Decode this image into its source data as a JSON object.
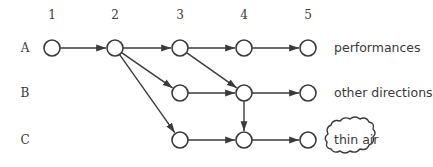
{
  "diagram": {
    "type": "directed-graph",
    "columns": [
      {
        "id": "1",
        "label": "1",
        "x": 52
      },
      {
        "id": "2",
        "label": "2",
        "x": 115
      },
      {
        "id": "3",
        "label": "3",
        "x": 180
      },
      {
        "id": "4",
        "label": "4",
        "x": 244
      },
      {
        "id": "5",
        "label": "5",
        "x": 308
      }
    ],
    "rows": [
      {
        "id": "A",
        "label": "A",
        "y": 48
      },
      {
        "id": "B",
        "label": "B",
        "y": 93
      },
      {
        "id": "C",
        "label": "C",
        "y": 140
      }
    ],
    "nodes": [
      {
        "id": "A1",
        "col": "1",
        "row": "A"
      },
      {
        "id": "A2",
        "col": "2",
        "row": "A"
      },
      {
        "id": "A3",
        "col": "3",
        "row": "A"
      },
      {
        "id": "A4",
        "col": "4",
        "row": "A"
      },
      {
        "id": "A5",
        "col": "5",
        "row": "A"
      },
      {
        "id": "B3",
        "col": "3",
        "row": "B"
      },
      {
        "id": "B4",
        "col": "4",
        "row": "B"
      },
      {
        "id": "B5",
        "col": "5",
        "row": "B"
      },
      {
        "id": "C3",
        "col": "3",
        "row": "C"
      },
      {
        "id": "C4",
        "col": "4",
        "row": "C"
      },
      {
        "id": "C5",
        "col": "5",
        "row": "C"
      }
    ],
    "edges": [
      {
        "from": "A1",
        "to": "A2"
      },
      {
        "from": "A2",
        "to": "A3"
      },
      {
        "from": "A2",
        "to": "B3"
      },
      {
        "from": "A2",
        "to": "C3"
      },
      {
        "from": "A3",
        "to": "A4"
      },
      {
        "from": "A3",
        "to": "B4"
      },
      {
        "from": "A4",
        "to": "A5"
      },
      {
        "from": "B3",
        "to": "B4"
      },
      {
        "from": "B4",
        "to": "B5"
      },
      {
        "from": "B4",
        "to": "C4"
      },
      {
        "from": "C3",
        "to": "C4"
      },
      {
        "from": "C4",
        "to": "C5"
      }
    ],
    "outcomes": [
      {
        "row": "A",
        "label": "performances",
        "shape": "text"
      },
      {
        "row": "B",
        "label": "other directions",
        "shape": "text"
      },
      {
        "row": "C",
        "label": "thin air",
        "shape": "cloud"
      }
    ],
    "colors": {
      "stroke": "#3a3a3a",
      "background": "#ffffff"
    }
  }
}
